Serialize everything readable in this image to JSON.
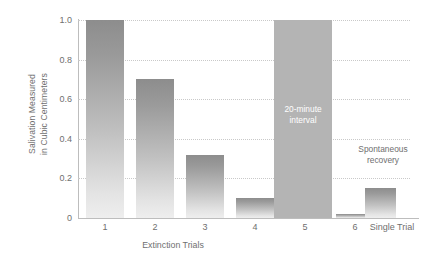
{
  "chart_data": {
    "type": "bar",
    "title": "",
    "subtitle": "",
    "xlabel": "Extinction Trials",
    "ylabel": "Salivation Measured\nin Cubic Centimeters",
    "ylim": [
      0,
      1.0
    ],
    "yticks": [
      "1.0",
      "0.8",
      "0.6",
      "0.4",
      "0.2",
      "0"
    ],
    "ytick_values": [
      1.0,
      0.8,
      0.6,
      0.4,
      0.2,
      0
    ],
    "grid": true,
    "legend": "none",
    "categories": [
      "1",
      "2",
      "3",
      "4",
      "5",
      "6",
      "",
      "Single Trial"
    ],
    "values": [
      1.0,
      0.7,
      0.32,
      0.1,
      0.05,
      0.02,
      null,
      0.15
    ],
    "series": [
      {
        "name": "Salivation",
        "values": [
          1.0,
          0.7,
          0.32,
          0.1,
          0.05,
          0.02,
          null,
          0.15
        ]
      }
    ],
    "bars": [
      {
        "label": "1",
        "value": 1.0
      },
      {
        "label": "2",
        "value": 0.7
      },
      {
        "label": "3",
        "value": 0.32
      },
      {
        "label": "4",
        "value": 0.1
      },
      {
        "label": "5",
        "value": 0.05
      },
      {
        "label": "6",
        "value": 0.02
      },
      {
        "label": "Single Trial",
        "value": 0.15
      }
    ],
    "annotations": [
      {
        "name": "interval-block",
        "text": "20-minute\ninterval",
        "value": 1.0
      },
      {
        "name": "spontaneous-recovery",
        "text": "Spontaneous\nrecovery"
      }
    ],
    "xtick_labels": [
      "1",
      "2",
      "3",
      "4",
      "5",
      "6",
      "Single Trial"
    ]
  },
  "colors": {
    "bar_top": "#8d8d8d",
    "bar_bottom": "#eeeeee",
    "block_gray": "#b4b4b4",
    "axis": "#bdbdbd",
    "grid": "#c9c9c9",
    "text": "#6f6f6f",
    "block_text": "#ffffff",
    "background": "#ffffff"
  }
}
